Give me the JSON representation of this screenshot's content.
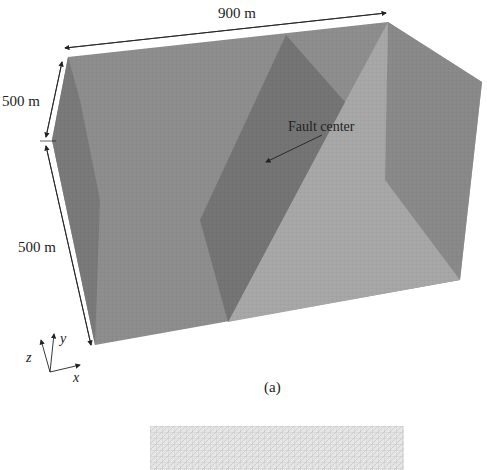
{
  "figure": {
    "panel_label": "(a)",
    "dimensions": {
      "length_label": "900 m",
      "height_upper_label": "500 m",
      "height_lower_label": "500 m"
    },
    "annotation": {
      "fault_center_label": "Fault center"
    },
    "axes": {
      "x_label": "x",
      "y_label": "y",
      "z_label": "z"
    },
    "colors": {
      "back_face": "#8e8e8e",
      "left_face": "#7c7c7c",
      "fault_plane": "#767676",
      "light_face": "#a9a9a9",
      "right_face": "#8f8f8f",
      "bottom_mesh": "#e4e4e4",
      "mesh_line": "#d0d0d0"
    }
  }
}
